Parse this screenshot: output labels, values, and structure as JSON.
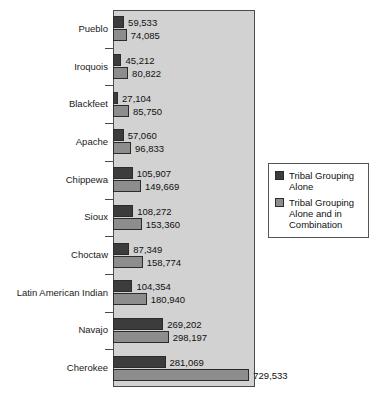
{
  "chart_data": {
    "type": "bar",
    "orientation": "horizontal",
    "title": "",
    "xlabel": "",
    "ylabel": "",
    "grid": false,
    "legend_position": "right",
    "xlim": [
      0,
      760000
    ],
    "categories": [
      "Pueblo",
      "Iroquois",
      "Blackfeet",
      "Apache",
      "Chippewa",
      "Sioux",
      "Choctaw",
      "Latin American Indian",
      "Navajo",
      "Cherokee"
    ],
    "series": [
      {
        "name": "Tribal Grouping Alone",
        "color": "#3c3c3c",
        "values": [
          59533,
          45212,
          27104,
          57060,
          105907,
          108272,
          87349,
          104354,
          269202,
          281069
        ],
        "labels": [
          "59,533",
          "45,212",
          "27,104",
          "57,060",
          "105,907",
          "108,272",
          "87,349",
          "104,354",
          "269,202",
          "281,069"
        ]
      },
      {
        "name": "Tribal Grouping Alone and in Combination",
        "color": "#8d8d8d",
        "values": [
          74085,
          80822,
          85750,
          96833,
          149669,
          153360,
          158774,
          180940,
          298197,
          729533
        ],
        "labels": [
          "74,085",
          "80,822",
          "85,750",
          "96,833",
          "149,669",
          "153,360",
          "158,774",
          "180,940",
          "298,197",
          "729,533"
        ]
      }
    ]
  },
  "legend": {
    "items": [
      {
        "label": "Tribal Grouping Alone",
        "swatch": "alone"
      },
      {
        "label": "Tribal Grouping Alone and in Combination",
        "swatch": "combo"
      }
    ]
  },
  "caption": {
    "text": ""
  },
  "colors": {
    "series_alone": "#3c3c3c",
    "series_combo": "#8d8d8d",
    "plot_background": "#d2d2d2",
    "axis": "#4a4a4a"
  }
}
